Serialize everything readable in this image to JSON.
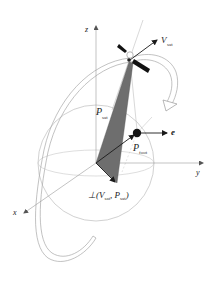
{
  "figure": {
    "type": "3D geometry diagram",
    "colors": {
      "background": "#ffffff",
      "lines": "#b0b0b0",
      "axes": "#9a9a9a",
      "vectors": "#1a1a1a",
      "triangle_fill": "#6e6e6e",
      "satellite": "#111111"
    }
  },
  "axes": {
    "x": "x",
    "y": "y",
    "z": "z"
  },
  "labels": {
    "v_sat_main": "V",
    "v_sat_sub": "sat",
    "p_sat_main": "P",
    "p_sat_sub": "sat",
    "p_foot_main": "P",
    "p_foot_sub": "foot",
    "e": "e",
    "perp_prefix": "⊥(V",
    "perp_sub1": "sat",
    "perp_mid": ", P",
    "perp_sub2": "sat",
    "perp_suffix": ")"
  },
  "icons": {
    "satellite": "satellite-icon",
    "rotation_arrow": "curved-arrow-icon"
  }
}
